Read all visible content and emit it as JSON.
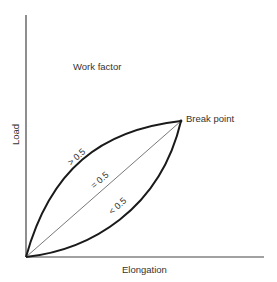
{
  "diagram": {
    "title": "Work factor",
    "x_axis_label": "Elongation",
    "y_axis_label": "Load",
    "break_point_label": "Break point",
    "curves": [
      {
        "id": "convex",
        "label": "> 0.5",
        "description": "upper curve, work factor greater than 0.5"
      },
      {
        "id": "linear",
        "label": "= 0.5",
        "description": "straight line, work factor equal to 0.5"
      },
      {
        "id": "concave",
        "label": "< 0.5",
        "description": "lower curve, work factor less than 0.5"
      }
    ],
    "colors": {
      "curve": "#1a1a1a",
      "axis": "#444444",
      "text": "#333333",
      "background": "#ffffff"
    }
  }
}
